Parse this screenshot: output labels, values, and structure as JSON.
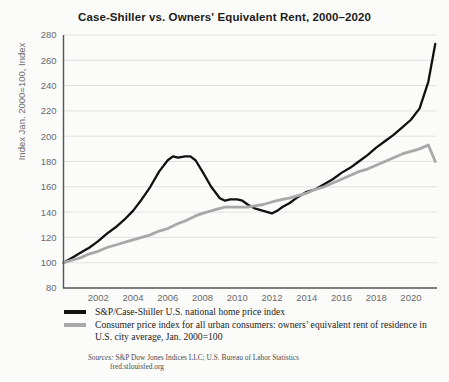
{
  "chart_data": {
    "type": "line",
    "title": "Case-Shiller vs. Owners' Equivalent Rent, 2000–2020",
    "xlabel": "",
    "ylabel": "Index Jan. 2000=100, Index",
    "ylim": [
      80,
      280
    ],
    "ytick_step": 20,
    "yticks": [
      80,
      100,
      120,
      140,
      160,
      180,
      200,
      220,
      240,
      260,
      280
    ],
    "xlim": [
      2000,
      2021.5
    ],
    "xticks": [
      2002,
      2004,
      2006,
      2008,
      2010,
      2012,
      2014,
      2016,
      2018,
      2020
    ],
    "grid": "horizontal",
    "legend_position": "below-axes",
    "x": [
      2000.0,
      2000.5,
      2001.0,
      2001.5,
      2002.0,
      2002.5,
      2003.0,
      2003.5,
      2004.0,
      2004.5,
      2005.0,
      2005.5,
      2006.0,
      2006.3,
      2006.6,
      2007.0,
      2007.3,
      2007.6,
      2008.0,
      2008.5,
      2009.0,
      2009.3,
      2009.6,
      2010.0,
      2010.3,
      2010.6,
      2011.0,
      2011.5,
      2012.0,
      2012.3,
      2012.6,
      2013.0,
      2013.5,
      2014.0,
      2014.5,
      2015.0,
      2015.5,
      2016.0,
      2016.5,
      2017.0,
      2017.5,
      2018.0,
      2018.5,
      2019.0,
      2019.5,
      2020.0,
      2020.5,
      2021.0,
      2021.4
    ],
    "series": [
      {
        "name": "S&P/Case-Shiller U.S. national home price index",
        "color": "#111111",
        "width": 2.3,
        "values": [
          100,
          104,
          108,
          112,
          117,
          123,
          128,
          134,
          141,
          150,
          160,
          172,
          181,
          184,
          183,
          184,
          184,
          181,
          172,
          160,
          151,
          149,
          150,
          150,
          149,
          146,
          143,
          141,
          139,
          141,
          144,
          147,
          152,
          156,
          158,
          162,
          166,
          171,
          175,
          180,
          185,
          191,
          196,
          201,
          207,
          213,
          222,
          243,
          273
        ]
      },
      {
        "name": "Consumer price index for all urban consumers: owners' equivalent rent of residence in U.S. city average, Jan. 2000=100",
        "color": "#a8a8a8",
        "width": 2.8,
        "values": [
          100,
          102,
          104,
          107,
          109,
          112,
          114,
          116,
          118,
          120,
          122,
          125,
          127,
          129,
          131,
          133,
          135,
          137,
          139,
          141,
          143,
          144,
          144,
          144,
          144,
          144,
          145,
          146,
          148,
          149,
          150,
          151,
          153,
          155,
          158,
          160,
          163,
          166,
          169,
          172,
          174,
          177,
          180,
          183,
          186,
          188,
          190,
          193,
          180
        ]
      }
    ],
    "series_rent_end_value": 180
  },
  "legend": {
    "entries": [
      {
        "label": "S&P/Case-Shiller U.S. national home price index",
        "color": "#111111"
      },
      {
        "label": "Consumer price index for all urban consumers: owners’ equivalent rent of residence in U.S. city average, Jan. 2000=100",
        "color": "#a8a8a8"
      }
    ]
  },
  "source": {
    "prefix": "Sources:",
    "line1": " S&P Dow Jones Indices LLC; U.S. Bureau of Labor Statistics",
    "line2": "fred.stlouisfed.org"
  },
  "colors": {
    "background": "#fbfbfa",
    "axis": "#555555",
    "grid": "#e2e2e2",
    "tick_text": "#6a6a6a",
    "title_text": "#1b1b1b"
  }
}
